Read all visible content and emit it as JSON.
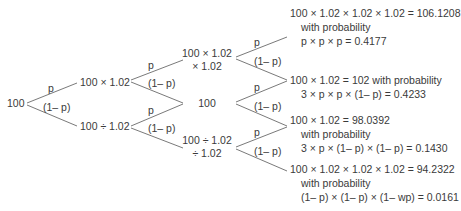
{
  "diagram": {
    "type": "binomial-tree",
    "root": {
      "label": "100"
    },
    "level1": {
      "up": {
        "label": "100 × 1.02"
      },
      "down": {
        "label": "100 ÷ 1.02"
      }
    },
    "level2": {
      "upup": {
        "line1": "100 × 1.02",
        "line2": "× 1.02"
      },
      "mid": {
        "label": "100"
      },
      "downdown": {
        "line1": "100 ÷ 1.02",
        "line2": "÷ 1.02"
      }
    },
    "branch_labels": {
      "up": "p",
      "down": "(1– p)"
    },
    "outcomes": [
      {
        "line1": "100 × 1.02 × 1.02 × 1.02 = 106.1208",
        "line2": "with probability",
        "line3": "p × p × p = 0.4177"
      },
      {
        "line1": "100 × 1.02 = 102 with probability",
        "line2": "3 × p × p × (1– p) = 0.4233"
      },
      {
        "line1": "100 × 1.02 = 98.0392",
        "line2": "with probability",
        "line3": "3 × p × (1– p) × (1– p) = 0.1430"
      },
      {
        "line1": "100 × 1.02 × 1.02 × 1.02 = 94.2322",
        "line2": "with probability",
        "line3": "(1– p) × (1– p) × (1– wp) = 0.0161"
      }
    ],
    "colors": {
      "line": "#6a6a6a",
      "text": "#3a3a3a",
      "background": "#ffffff"
    }
  }
}
